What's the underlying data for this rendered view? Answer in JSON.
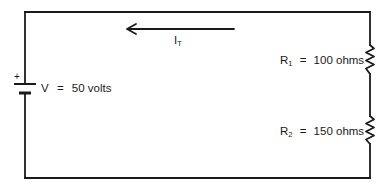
{
  "diagram": {
    "type": "series circuit",
    "colors": {
      "wire": "#1a1a1a",
      "background": "#ffffff"
    },
    "battery": {
      "polarity_label": "+",
      "label_prefix": "V",
      "label_eq": "=",
      "value": "50 volts"
    },
    "current": {
      "symbol": "I",
      "subscript": "T",
      "direction": "left"
    },
    "resistors": [
      {
        "symbol": "R",
        "subscript": "1",
        "eq": "=",
        "value": "100 ohms"
      },
      {
        "symbol": "R",
        "subscript": "2",
        "eq": "=",
        "value": "150 ohms"
      }
    ]
  }
}
